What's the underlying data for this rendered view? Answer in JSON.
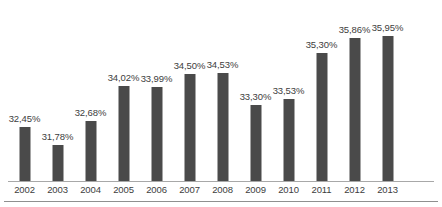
{
  "chart_data": {
    "type": "bar",
    "title": "",
    "subtitle": "",
    "xlabel": "",
    "ylabel": "",
    "grid": false,
    "legend": false,
    "legend_position": "none",
    "axis_baseline_value": 30.4,
    "ylim": [
      30.4,
      36.4
    ],
    "value_suffix": "%",
    "decimal_separator": ",",
    "bar_color": "#4a4a4a",
    "label_color": "#3d3d3d",
    "axis_color": "#a8a8a8",
    "categories": [
      "2002",
      "2003",
      "2004",
      "2005",
      "2006",
      "2007",
      "2008",
      "2009",
      "2010",
      "2011",
      "2012",
      "2013"
    ],
    "values": [
      32.45,
      31.78,
      32.68,
      34.02,
      33.99,
      34.5,
      34.53,
      33.3,
      33.53,
      35.3,
      35.86,
      35.95
    ],
    "data_labels": [
      "32,45%",
      "31,78%",
      "32,68%",
      "34,02%",
      "33,99%",
      "34,50%",
      "34,53%",
      "33,30%",
      "33,53%",
      "35,30%",
      "35,86%",
      "35,95%"
    ]
  }
}
